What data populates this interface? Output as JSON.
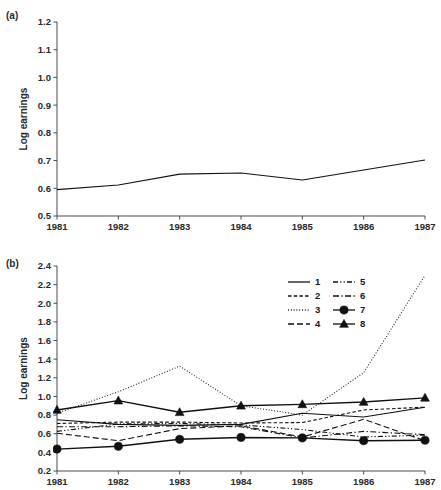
{
  "figure": {
    "panel_a_tag": "(a)",
    "panel_b_tag": "(b)"
  },
  "chart_data": [
    {
      "type": "line",
      "panel": "(a)",
      "title": "",
      "xlabel": "",
      "ylabel": "Log earnings",
      "grid": false,
      "legend": "none",
      "x": [
        "1981",
        "1982",
        "1983",
        "1984",
        "1985",
        "1986",
        "1987"
      ],
      "xlim": [
        1981,
        1987
      ],
      "ylim": [
        0.5,
        1.2
      ],
      "yticks": [
        "0.5",
        "0.6",
        "0.7",
        "0.8",
        "0.9",
        "1.0",
        "1.1",
        "1.2"
      ],
      "xticks": [
        "1981",
        "1982",
        "1983",
        "1984",
        "1985",
        "1986",
        "1987"
      ],
      "series": [
        {
          "name": "1",
          "style": "solid",
          "marker": "none",
          "values": [
            0.595,
            0.612,
            0.651,
            0.655,
            0.63,
            0.666,
            0.702
          ]
        }
      ]
    },
    {
      "type": "line",
      "panel": "(b)",
      "title": "",
      "xlabel": "",
      "ylabel": "Log earnings",
      "grid": false,
      "legend": "upper right",
      "x": [
        "1981",
        "1982",
        "1983",
        "1984",
        "1985",
        "1986",
        "1987"
      ],
      "xlim": [
        1981,
        1987
      ],
      "ylim": [
        0.2,
        2.4
      ],
      "yticks": [
        "0.2",
        "0.4",
        "0.6",
        "0.8",
        "1.0",
        "1.2",
        "1.4",
        "1.6",
        "1.8",
        "2.0",
        "2.2",
        "2.4"
      ],
      "xticks": [
        "1981",
        "1982",
        "1983",
        "1984",
        "1985",
        "1986",
        "1987"
      ],
      "series": [
        {
          "name": "1",
          "style": "solid",
          "marker": "none",
          "values": [
            0.75,
            0.7,
            0.69,
            0.7,
            0.82,
            0.78,
            0.885
          ]
        },
        {
          "name": "2",
          "style": "dashed",
          "marker": "none",
          "values": [
            0.71,
            0.725,
            0.725,
            0.715,
            0.72,
            0.855,
            0.885
          ]
        },
        {
          "name": "3",
          "style": "dotted",
          "marker": "none",
          "values": [
            0.82,
            1.05,
            1.325,
            0.9,
            0.8,
            1.255,
            2.3
          ]
        },
        {
          "name": "4",
          "style": "longdash",
          "marker": "none",
          "values": [
            0.605,
            0.525,
            0.655,
            0.685,
            0.565,
            0.755,
            0.525
          ]
        },
        {
          "name": "5",
          "style": "dashdotdot",
          "marker": "none",
          "values": [
            0.625,
            0.705,
            0.71,
            0.695,
            0.645,
            0.565,
            0.585
          ]
        },
        {
          "name": "6",
          "style": "dashdot",
          "marker": "none",
          "values": [
            0.675,
            0.675,
            0.685,
            0.675,
            0.555,
            0.625,
            0.59
          ]
        },
        {
          "name": "7",
          "style": "solid-circle",
          "marker": "circle",
          "values": [
            0.435,
            0.465,
            0.54,
            0.56,
            0.555,
            0.525,
            0.53
          ]
        },
        {
          "name": "8",
          "style": "solid-triangle",
          "marker": "triangle",
          "values": [
            0.855,
            0.955,
            0.83,
            0.9,
            0.915,
            0.94,
            0.985
          ]
        }
      ],
      "legend_entries": [
        {
          "label": "1",
          "style": "solid",
          "marker": "none"
        },
        {
          "label": "2",
          "style": "dashed",
          "marker": "none"
        },
        {
          "label": "3",
          "style": "dotted",
          "marker": "none"
        },
        {
          "label": "4",
          "style": "longdash",
          "marker": "none"
        },
        {
          "label": "5",
          "style": "dashdotdot",
          "marker": "none"
        },
        {
          "label": "6",
          "style": "dashdot",
          "marker": "none"
        },
        {
          "label": "7",
          "style": "solid",
          "marker": "circle"
        },
        {
          "label": "8",
          "style": "solid",
          "marker": "triangle"
        }
      ]
    }
  ],
  "colors": {
    "line": "#111111",
    "axis": "#4a4a4a",
    "text": "#1a1a1a",
    "background": "#ffffff"
  }
}
